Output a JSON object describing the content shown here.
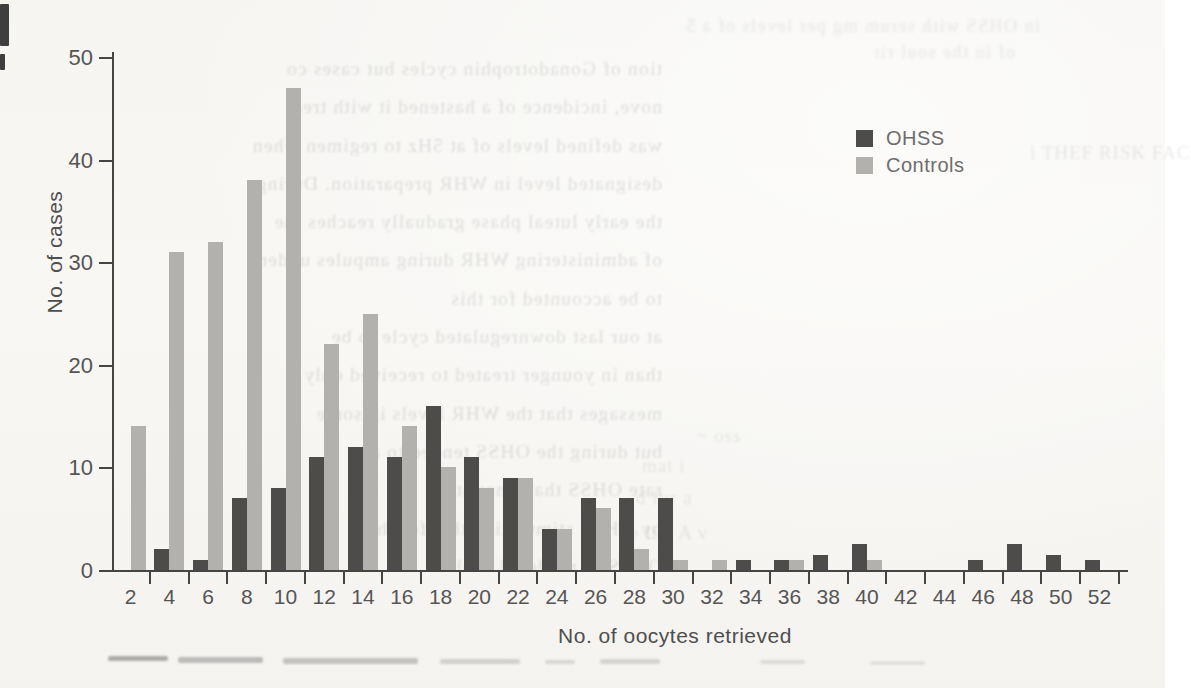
{
  "document": {
    "kind": "scanned journal figure",
    "background_color": "#f7f6f3"
  },
  "chart_data": {
    "type": "bar",
    "title": "",
    "xlabel": "No. of oocytes retrieved",
    "ylabel": "No. of cases",
    "categories": [
      2,
      4,
      6,
      8,
      10,
      12,
      14,
      16,
      18,
      20,
      22,
      24,
      26,
      28,
      30,
      32,
      34,
      36,
      38,
      40,
      42,
      44,
      46,
      48,
      50,
      52
    ],
    "series": [
      {
        "name": "OHSS",
        "color": "#4d4c4a",
        "values": [
          0,
          2,
          1,
          7,
          8,
          11,
          12,
          11,
          16,
          11,
          9,
          4,
          7,
          7,
          7,
          0,
          1,
          1,
          1.5,
          2.5,
          0,
          0,
          1,
          2.5,
          1.5,
          1
        ]
      },
      {
        "name": "Controls",
        "color": "#b2b1ae",
        "values": [
          14,
          31,
          32,
          38,
          47,
          22,
          25,
          14,
          10,
          8,
          9,
          4,
          6,
          2,
          1,
          1,
          0,
          1,
          0,
          1,
          0,
          0,
          0,
          0,
          0,
          0
        ]
      }
    ],
    "ylim": [
      0,
      50
    ],
    "y_ticks": [
      0,
      10,
      20,
      30,
      40,
      50
    ],
    "grid": false,
    "legend_position": "upper-right-inside",
    "axis_color": "#454545",
    "tick_label_color": "#555555"
  },
  "legend": {
    "items": [
      {
        "label": "OHSS",
        "swatch_color": "#4d4c4a"
      },
      {
        "label": "Controls",
        "swatch_color": "#b2b1ae"
      }
    ]
  },
  "scan_artifacts": {
    "bleed_column_lines": [
      "tion of Gonadotrophin cycles but cases co",
      "nove, incidence of a hastened it with treat",
      "was defined levels of at 5Hz to regimen when",
      "designated level in WHR preparation. During",
      "the early luteal phase gradually reaches the",
      "of administering WHR during ampules under",
      "to be accounted for this",
      "at our last downregulated cycle to be",
      "than in younger treated to received only",
      "messages that the WHR levels in some",
      "but during the OHSS tended to a",
      "rate OHSS that amount",
      "by OHSS stimulation that for the",
      "OHSS of rendered trials"
    ],
    "bleed_top_lines": [
      {
        "text": "in OHSS with serum mg per levels of a 5",
        "x": 620,
        "y": 16,
        "w": 420
      },
      {
        "text": "of in the soul rim",
        "x": 875,
        "y": 42,
        "w": 140
      }
    ],
    "faint_fragments": [
      {
        "text": "i THEF RISK FAC",
        "x": 1030,
        "y": 142
      },
      {
        "text": "~ oss",
        "x": 697,
        "y": 425
      },
      {
        "text": "mat i",
        "x": 642,
        "y": 455
      },
      {
        "text": "d fur a",
        "x": 636,
        "y": 487
      },
      {
        "text": "e lim A v",
        "x": 630,
        "y": 522
      }
    ],
    "bottom_smudges": [
      {
        "x": 108,
        "y": 656,
        "w": 60,
        "h": 5,
        "o": 0.45
      },
      {
        "x": 178,
        "y": 657,
        "w": 85,
        "h": 6,
        "o": 0.35
      },
      {
        "x": 283,
        "y": 658,
        "w": 135,
        "h": 6,
        "o": 0.3
      },
      {
        "x": 440,
        "y": 659,
        "w": 80,
        "h": 5,
        "o": 0.22
      },
      {
        "x": 545,
        "y": 660,
        "w": 30,
        "h": 4,
        "o": 0.18
      },
      {
        "x": 600,
        "y": 659,
        "w": 60,
        "h": 5,
        "o": 0.2
      },
      {
        "x": 760,
        "y": 660,
        "w": 45,
        "h": 4,
        "o": 0.15
      },
      {
        "x": 870,
        "y": 661,
        "w": 55,
        "h": 4,
        "o": 0.12
      }
    ],
    "corner_marks": [
      {
        "x": 0,
        "y": 4,
        "w": 9,
        "h": 42
      },
      {
        "x": 0,
        "y": 54,
        "w": 5,
        "h": 16
      }
    ]
  }
}
